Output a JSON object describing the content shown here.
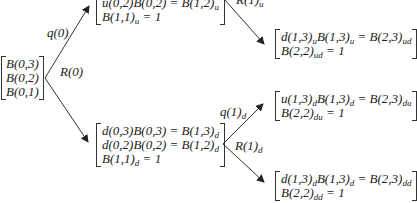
{
  "root": {
    "rows": [
      "B(0,3)",
      "B(0,2)",
      "B(0,1)"
    ]
  },
  "up_node": {
    "rows": [
      {
        "main": "u(0,2)B(0,2) = B(1,2)",
        "sub": "u"
      },
      {
        "main": "B(1,1)",
        "sub": "u",
        "tail": " = 1"
      }
    ]
  },
  "down_node": {
    "rows": [
      {
        "main": "d(0,3)B(0,3) = B(1,3)",
        "sub": "d"
      },
      {
        "main": "d(0,2)B(0,2) = B(1,2)",
        "sub": "d"
      },
      {
        "main": "B(1,1)",
        "sub": "d",
        "tail": " = 1"
      }
    ]
  },
  "ud_node": {
    "row1": {
      "a": "d(1,3)",
      "a_sub": "u",
      "b": "B(1,3)",
      "b_sub": "u",
      "c": " = B(2,3)",
      "c_sub": "ud"
    },
    "row2": {
      "a": "B(2,2)",
      "a_sub": "ud",
      "tail": " = 1"
    }
  },
  "du_node": {
    "row1": {
      "a": "u(1,3)",
      "a_sub": "d",
      "b": "B(1,3)",
      "b_sub": "d",
      "c": " = B(2,3)",
      "c_sub": "du"
    },
    "row2": {
      "a": "B(2,2)",
      "a_sub": "du",
      "tail": " = 1"
    }
  },
  "dd_node": {
    "row1": {
      "a": "d(1,3)",
      "a_sub": "d",
      "b": "B(1,3)",
      "b_sub": "d",
      "c": " = B(2,3)",
      "c_sub": "dd"
    },
    "row2": {
      "a": "B(2,2)",
      "a_sub": "dd",
      "tail": " = 1"
    }
  },
  "labels": {
    "q0": "q(0)",
    "r0": "R(0)",
    "r1u_main": "R(1)",
    "r1u_sub": "u",
    "q1d_main": "q(1)",
    "q1d_sub": "d",
    "r1d_main": "R(1)",
    "r1d_sub": "d"
  },
  "colors": {
    "line": "#333333",
    "text": "#222222"
  }
}
